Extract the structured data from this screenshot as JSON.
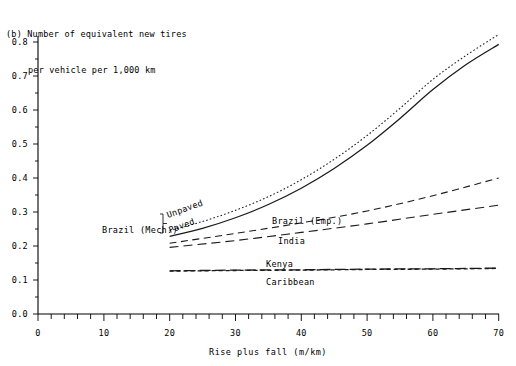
{
  "figure": {
    "panel_tag": "(b)",
    "title_line1": "(b) Number of equivalent new tires",
    "title_line2": "per vehicle per 1,000 km"
  },
  "chart_data": {
    "type": "line",
    "title": "(b) Number of equivalent new tires per vehicle per 1,000 km",
    "xlabel": "Rise plus fall (m/km)",
    "ylabel": "Number of equivalent new tires per vehicle per 1,000 km",
    "xlim": [
      0,
      70
    ],
    "ylim": [
      0.0,
      0.8
    ],
    "xticks": [
      0,
      10,
      20,
      30,
      40,
      50,
      60,
      70
    ],
    "xtick_labels": [
      "0",
      "10",
      "20",
      "30",
      "40",
      "50",
      "60",
      "70"
    ],
    "xminor_step": 2,
    "yticks": [
      0.0,
      0.1,
      0.2,
      0.3,
      0.4,
      0.5,
      0.6,
      0.7,
      0.8
    ],
    "ytick_labels": [
      "0.0",
      "0.1",
      "0.2",
      "0.3",
      "0.4",
      "0.5",
      "0.6",
      "0.7",
      "0.8"
    ],
    "yminor_step": 0.05,
    "grid": false,
    "legend_position": "inline-annotations",
    "series": [
      {
        "name": "Unpaved",
        "group": "Brazil (Mech.)",
        "style": "dotted",
        "x": [
          20,
          25,
          30,
          35,
          40,
          45,
          50,
          55,
          60,
          65,
          70
        ],
        "values": [
          0.245,
          0.272,
          0.305,
          0.345,
          0.395,
          0.455,
          0.525,
          0.605,
          0.69,
          0.76,
          0.822
        ]
      },
      {
        "name": "Paved",
        "group": "Brazil (Mech.)",
        "style": "solid",
        "x": [
          20,
          25,
          30,
          35,
          40,
          45,
          50,
          55,
          60,
          65,
          70
        ],
        "values": [
          0.228,
          0.252,
          0.283,
          0.322,
          0.37,
          0.428,
          0.496,
          0.575,
          0.66,
          0.733,
          0.793
        ]
      },
      {
        "name": "Brazil (Emp.)",
        "group": "",
        "style": "dashed",
        "x": [
          20,
          30,
          40,
          50,
          60,
          70
        ],
        "values": [
          0.208,
          0.237,
          0.268,
          0.303,
          0.348,
          0.4
        ]
      },
      {
        "name": "India",
        "group": "",
        "style": "long-dash",
        "x": [
          20,
          30,
          40,
          50,
          60,
          70
        ],
        "values": [
          0.196,
          0.216,
          0.24,
          0.265,
          0.293,
          0.32
        ]
      },
      {
        "name": "Kenya",
        "group": "",
        "style": "dash-dot",
        "x": [
          20,
          30,
          40,
          50,
          60,
          70
        ],
        "values": [
          0.127,
          0.129,
          0.13,
          0.132,
          0.133,
          0.135
        ]
      },
      {
        "name": "Caribbean",
        "group": "",
        "style": "dash-dot-overlay",
        "x": [
          20,
          30,
          40,
          50,
          60,
          70
        ],
        "values": [
          0.126,
          0.128,
          0.129,
          0.131,
          0.132,
          0.134
        ]
      }
    ],
    "annotations": [
      {
        "text": "Brazil (Mech.)",
        "x_px": 102,
        "y_px": 230
      },
      {
        "text": "Unpaved",
        "x_px": 166,
        "y_px": 216
      },
      {
        "text": "Paved",
        "x_px": 170,
        "y_px": 230
      },
      {
        "text": "Brazil (Emp.)",
        "x_px": 272,
        "y_px": 221
      },
      {
        "text": "India",
        "x_px": 278,
        "y_px": 241
      },
      {
        "text": "Kenya",
        "x_px": 266,
        "y_px": 265
      },
      {
        "text": "Caribbean",
        "x_px": 266,
        "y_px": 282
      }
    ],
    "colors": {
      "line": "#1a1a1a",
      "axis": "#000000",
      "background": "#ffffff"
    }
  }
}
